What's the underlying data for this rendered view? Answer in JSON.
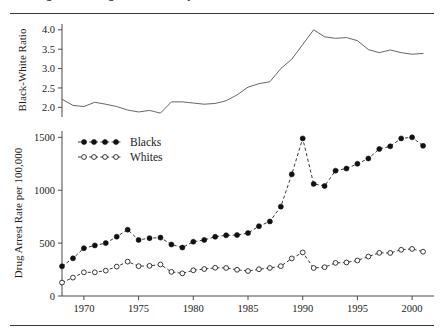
{
  "figure": {
    "caption_clipped": "Figure 3.2  Drug Arrest Rates by Race",
    "background": "#ffffff",
    "ink": "#1a1a1a"
  },
  "chart_data": [
    {
      "type": "line",
      "panel": "top",
      "title": "",
      "xlabel": "",
      "ylabel": "Black-White Ratio",
      "xlim": [
        1968,
        2002
      ],
      "ylim": [
        1.75,
        4.15
      ],
      "yticks": [
        2.0,
        2.5,
        3.0,
        3.5,
        4.0
      ],
      "ytick_labels": [
        "2.0",
        "2.5",
        "3.0",
        "3.5",
        "4.0"
      ],
      "xticks": [
        1970,
        1975,
        1980,
        1985,
        1990,
        1995,
        2000
      ],
      "xtick_labels": [
        "1970",
        "1975",
        "1980",
        "1985",
        "1990",
        "1995",
        "2000"
      ],
      "grid": false,
      "legend": "none",
      "series": [
        {
          "name": "Black-White Ratio",
          "marker": "none",
          "linestyle": "solid",
          "color": "#555555",
          "x": [
            1968,
            1969,
            1970,
            1971,
            1972,
            1973,
            1974,
            1975,
            1976,
            1977,
            1978,
            1979,
            1980,
            1981,
            1982,
            1983,
            1984,
            1985,
            1986,
            1987,
            1988,
            1989,
            1990,
            1991,
            1992,
            1993,
            1994,
            1995,
            1996,
            1997,
            1998,
            1999,
            2000,
            2001
          ],
          "values": [
            2.21,
            2.05,
            2.02,
            2.13,
            2.08,
            2.02,
            1.93,
            1.88,
            1.92,
            1.85,
            2.14,
            2.14,
            2.11,
            2.08,
            2.1,
            2.17,
            2.32,
            2.52,
            2.61,
            2.66,
            3.0,
            3.24,
            3.62,
            4.0,
            3.82,
            3.78,
            3.8,
            3.72,
            3.49,
            3.41,
            3.48,
            3.41,
            3.37,
            3.39
          ]
        }
      ]
    },
    {
      "type": "line",
      "panel": "bottom",
      "title": "",
      "xlabel": "",
      "ylabel": "Drug Arrest Rate per 100,000",
      "xlim": [
        1968,
        2002
      ],
      "ylim": [
        0,
        1560
      ],
      "yticks": [
        0,
        500,
        1000,
        1500
      ],
      "ytick_labels": [
        "0",
        "500",
        "1000",
        "1500"
      ],
      "xticks": [
        1970,
        1975,
        1980,
        1985,
        1990,
        1995,
        2000
      ],
      "xtick_labels": [
        "1970",
        "1975",
        "1980",
        "1985",
        "1990",
        "1995",
        "2000"
      ],
      "grid": false,
      "legend": "upper-left",
      "series": [
        {
          "name": "Blacks",
          "marker": "filled-circle",
          "linestyle": "dashed",
          "color": "#111111",
          "x": [
            1968,
            1969,
            1970,
            1971,
            1972,
            1973,
            1974,
            1975,
            1976,
            1977,
            1978,
            1979,
            1980,
            1981,
            1982,
            1983,
            1984,
            1985,
            1986,
            1987,
            1988,
            1989,
            1990,
            1991,
            1992,
            1993,
            1994,
            1995,
            1996,
            1997,
            1998,
            1999,
            2000,
            2001
          ],
          "values": [
            281,
            356,
            452,
            478,
            500,
            561,
            627,
            530,
            547,
            552,
            487,
            458,
            513,
            530,
            560,
            574,
            576,
            595,
            660,
            705,
            845,
            1150,
            1490,
            1060,
            1040,
            1185,
            1205,
            1250,
            1300,
            1390,
            1415,
            1490,
            1500,
            1420,
            1165
          ]
        },
        {
          "name": "Whites",
          "marker": "open-circle",
          "linestyle": "dashed",
          "color": "#222222",
          "x": [
            1968,
            1969,
            1970,
            1971,
            1972,
            1973,
            1974,
            1975,
            1976,
            1977,
            1978,
            1979,
            1980,
            1981,
            1982,
            1983,
            1984,
            1985,
            1986,
            1987,
            1988,
            1989,
            1990,
            1991,
            1992,
            1993,
            1994,
            1995,
            1996,
            1997,
            1998,
            1999,
            2000,
            2001
          ],
          "values": [
            127,
            174,
            224,
            224,
            240,
            278,
            325,
            282,
            285,
            298,
            228,
            214,
            243,
            255,
            267,
            265,
            248,
            236,
            253,
            265,
            282,
            355,
            412,
            265,
            272,
            313,
            317,
            336,
            373,
            408,
            407,
            437,
            445,
            419,
            344
          ]
        }
      ]
    }
  ],
  "legend": {
    "items": [
      {
        "label": "Blacks",
        "marker": "filled-circle"
      },
      {
        "label": "Whites",
        "marker": "open-circle"
      }
    ]
  }
}
